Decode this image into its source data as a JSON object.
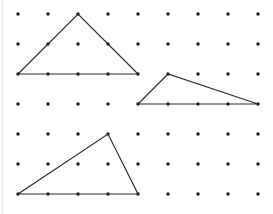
{
  "figure": {
    "width": 273,
    "height": 214,
    "background_color": "#ffffff",
    "edge_rule_color": "#e9eaec"
  },
  "grid": {
    "name": "geoboard-dot-grid",
    "columns": 9,
    "rows": 7,
    "origin_x": 18,
    "origin_y": 14,
    "spacing_x": 30,
    "spacing_y": 30,
    "dot_radius": 1.7,
    "dot_color": "#1a1a1a",
    "column_x": [
      18,
      48,
      78,
      108,
      138,
      168,
      198,
      228,
      258
    ],
    "row_y": [
      14,
      44,
      74,
      104,
      134,
      164,
      194
    ]
  },
  "shapes": [
    {
      "name": "triangle-top-left",
      "label": "Triangle 1",
      "type": "triangle",
      "stroke_color": "#2b2b2b",
      "stroke_width": 1.15,
      "fill": "none",
      "points": "18,74 78,14 138,74",
      "vertices": [
        {
          "x": 18,
          "y": 74,
          "grid_col": 0,
          "grid_row": 2
        },
        {
          "x": 78,
          "y": 14,
          "grid_col": 2,
          "grid_row": 0
        },
        {
          "x": 138,
          "y": 74,
          "grid_col": 4,
          "grid_row": 2
        }
      ],
      "base_units": 4,
      "height_units": 2
    },
    {
      "name": "triangle-middle-right",
      "label": "Triangle 2",
      "type": "triangle",
      "stroke_color": "#2b2b2b",
      "stroke_width": 1.15,
      "fill": "none",
      "points": "138,104 168,74 258,104",
      "vertices": [
        {
          "x": 138,
          "y": 104,
          "grid_col": 4,
          "grid_row": 3
        },
        {
          "x": 168,
          "y": 74,
          "grid_col": 5,
          "grid_row": 2
        },
        {
          "x": 258,
          "y": 104,
          "grid_col": 8,
          "grid_row": 3
        }
      ],
      "base_units": 4,
      "height_units": 1
    },
    {
      "name": "triangle-bottom-left",
      "label": "Triangle 3",
      "type": "triangle",
      "stroke_color": "#2b2b2b",
      "stroke_width": 1.15,
      "fill": "none",
      "points": "18,194 108,134 138,194",
      "vertices": [
        {
          "x": 18,
          "y": 194,
          "grid_col": 0,
          "grid_row": 6
        },
        {
          "x": 108,
          "y": 134,
          "grid_col": 3,
          "grid_row": 4
        },
        {
          "x": 138,
          "y": 194,
          "grid_col": 4,
          "grid_row": 6
        }
      ],
      "base_units": 4,
      "height_units": 2
    }
  ]
}
